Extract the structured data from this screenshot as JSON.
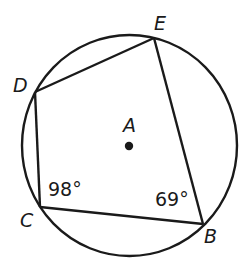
{
  "diagram": {
    "type": "inscribed-quadrilateral",
    "colors": {
      "stroke": "#1a1a1a",
      "background": "#ffffff"
    },
    "circle": {
      "center_label": "A",
      "cx": 129.5,
      "cy": 145.5,
      "rx": 107.5,
      "ry": 110.5
    },
    "center_point": {
      "label": "A",
      "x": 129,
      "y": 146
    },
    "vertices": [
      {
        "label": "E",
        "x": 154,
        "y": 38
      },
      {
        "label": "D",
        "x": 35,
        "y": 92
      },
      {
        "label": "C",
        "x": 40,
        "y": 207
      },
      {
        "label": "B",
        "x": 203,
        "y": 224
      }
    ],
    "angles": [
      {
        "vertex": "C",
        "text": "98°",
        "value": 98
      },
      {
        "vertex": "B",
        "text": "69°",
        "value": 69
      }
    ],
    "labels": {
      "A": "A",
      "B": "B",
      "C": "C",
      "D": "D",
      "E": "E",
      "angle_C": "98°",
      "angle_B": "69°"
    }
  }
}
